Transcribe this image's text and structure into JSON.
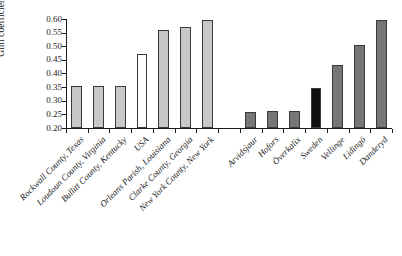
{
  "chart_data": {
    "type": "bar",
    "title": "",
    "xlabel": "",
    "ylabel": "Gini coefficient",
    "ylim": [
      0.2,
      0.6
    ],
    "ytick_labels": [
      "0.60",
      "0.55",
      "0.50",
      "0.45",
      "0.40",
      "0.35",
      "0.30",
      "0.25",
      "0.20"
    ],
    "ytick_values": [
      0.6,
      0.55,
      0.5,
      0.45,
      0.4,
      0.35,
      0.3,
      0.25,
      0.2
    ],
    "grid": false,
    "legend": "none",
    "categories": [
      "Rockwall County, Texas",
      "Loudoun County, Virginia",
      "Bullitt County, Kentucky",
      "USA",
      "Orleans Parish, Louisiana",
      "Clarke County, Georgia",
      "New York County, New York",
      "",
      "Arvidsjaur",
      "Hofors",
      "Överkalix",
      "Sweden",
      "Vellinge",
      "Lidingö",
      "Danderyd"
    ],
    "values": [
      0.353,
      0.356,
      0.356,
      0.473,
      0.559,
      0.572,
      0.598,
      null,
      0.258,
      0.262,
      0.263,
      0.346,
      0.431,
      0.505,
      0.597
    ],
    "bar_colors": [
      "#c8c8c8",
      "#c8c8c8",
      "#c8c8c8",
      "#ffffff",
      "#c8c8c8",
      "#c8c8c8",
      "#c8c8c8",
      "none",
      "#767676",
      "#767676",
      "#767676",
      "#111111",
      "#767676",
      "#767676",
      "#767676"
    ]
  }
}
